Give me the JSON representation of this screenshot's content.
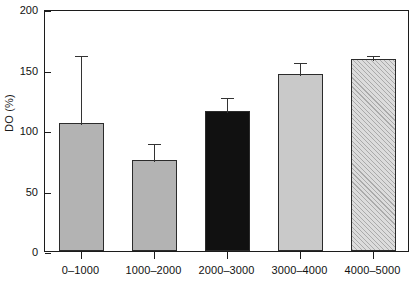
{
  "chart_data": {
    "type": "bar",
    "title": "",
    "subtitle": "",
    "xlabel": "",
    "ylabel": "DO (%)",
    "categories": [
      "0–1000",
      "1000–2000",
      "2000–3000",
      "3000–4000",
      "4000–5000"
    ],
    "values": [
      106,
      75,
      116,
      146,
      159
    ],
    "errors": [
      57,
      15,
      12,
      11,
      4
    ],
    "error_type": "upper-only",
    "ylim": [
      0,
      200
    ],
    "yticks": [
      0,
      50,
      100,
      150,
      200
    ],
    "ytick_labels": [
      "0",
      "50",
      "100",
      "150",
      "200"
    ],
    "grid": false,
    "legend": null,
    "bar_styles": [
      "solid-gray",
      "solid-gray",
      "solid-black",
      "solid-light-gray",
      "hatched-diagonal"
    ],
    "colors": {
      "bar_gray": "#b3b3b3",
      "bar_black": "#111111",
      "bar_light_gray": "#c9c9c9",
      "bar_hatch": "#dcdcdc",
      "axis": "#1c1c1c",
      "error_bar": "#333333",
      "background": "#ffffff"
    }
  }
}
